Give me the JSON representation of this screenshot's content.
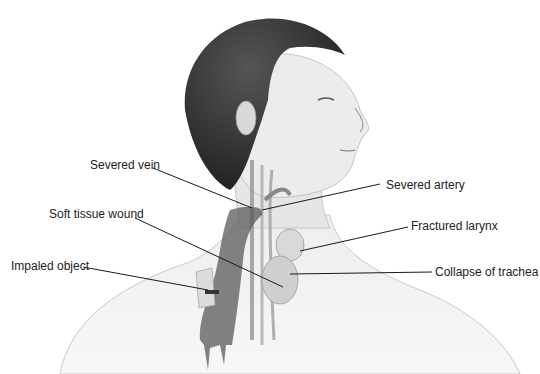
{
  "diagram": {
    "labels": [
      {
        "id": "severed-vein",
        "text": "Severed vein",
        "x": 90,
        "y": 158
      },
      {
        "id": "soft-tissue-wound",
        "text": "Soft tissue wound",
        "x": 49,
        "y": 207
      },
      {
        "id": "impaled-object",
        "text": "Impaled object",
        "x": 11,
        "y": 259
      },
      {
        "id": "severed-artery",
        "text": "Severed artery",
        "x": 386,
        "y": 178
      },
      {
        "id": "fractured-larynx",
        "text": "Fractured larynx",
        "x": 411,
        "y": 219
      },
      {
        "id": "collapse-of-trachea",
        "text": "Collapse of trachea",
        "x": 435,
        "y": 265
      }
    ],
    "leaders": [
      {
        "id": "severed-vein",
        "x1": 153,
        "y1": 168,
        "x2": 252,
        "y2": 208
      },
      {
        "id": "soft-tissue-wound",
        "x1": 135,
        "y1": 218,
        "x2": 283,
        "y2": 287
      },
      {
        "id": "impaled-object",
        "x1": 83,
        "y1": 267,
        "x2": 208,
        "y2": 290
      },
      {
        "id": "severed-artery",
        "x1": 380,
        "y1": 184,
        "x2": 262,
        "y2": 210
      },
      {
        "id": "fractured-larynx",
        "x1": 408,
        "y1": 227,
        "x2": 300,
        "y2": 251
      },
      {
        "id": "collapse-of-trachea",
        "x1": 432,
        "y1": 272,
        "x2": 290,
        "y2": 274
      }
    ]
  }
}
